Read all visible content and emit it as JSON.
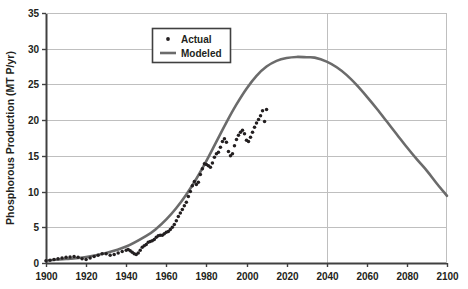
{
  "chart_data": {
    "type": "line",
    "title": "",
    "xlabel": "",
    "ylabel": "Phosphorous Production (MT P/yr)",
    "xlim": [
      1900,
      2100
    ],
    "ylim": [
      0,
      35
    ],
    "grid": "horizontal-and-vertical-major",
    "legend_position": "top-center",
    "xticks": [
      1900,
      1920,
      1940,
      1960,
      1980,
      2000,
      2020,
      2040,
      2060,
      2080,
      2100
    ],
    "yticks": [
      0,
      5,
      10,
      15,
      20,
      25,
      30,
      35
    ],
    "xtick_labels": [
      "1900",
      "1920",
      "1940",
      "1960",
      "1980",
      "2000",
      "2020",
      "2040",
      "2060",
      "2080",
      "2100"
    ],
    "ytick_labels": [
      "0",
      "5",
      "10",
      "15",
      "20",
      "25",
      "30",
      "35"
    ],
    "series": [
      {
        "name": "Actual",
        "type": "scatter",
        "marker": "dot",
        "color": "#231f20",
        "x": [
          1900,
          1902,
          1904,
          1906,
          1908,
          1910,
          1912,
          1914,
          1916,
          1918,
          1920,
          1922,
          1924,
          1926,
          1928,
          1930,
          1932,
          1934,
          1936,
          1938,
          1940,
          1941,
          1942,
          1943,
          1944,
          1945,
          1946,
          1947,
          1948,
          1949,
          1950,
          1951,
          1952,
          1953,
          1954,
          1955,
          1956,
          1957,
          1958,
          1959,
          1960,
          1961,
          1962,
          1963,
          1964,
          1965,
          1966,
          1967,
          1968,
          1969,
          1970,
          1971,
          1972,
          1973,
          1974,
          1975,
          1976,
          1977,
          1978,
          1979,
          1980,
          1981,
          1982,
          1983,
          1984,
          1985,
          1986,
          1987,
          1988,
          1989,
          1990,
          1991,
          1992,
          1993,
          1994,
          1995,
          1996,
          1997,
          1998,
          1999,
          2000,
          2001,
          2002,
          2003,
          2004,
          2005,
          2006,
          2007,
          2008,
          2009,
          2010
        ],
        "y": [
          0.3,
          0.4,
          0.5,
          0.6,
          0.7,
          0.8,
          0.85,
          0.9,
          0.8,
          0.6,
          0.5,
          0.7,
          0.9,
          1.1,
          1.3,
          1.3,
          1.1,
          1.2,
          1.4,
          1.6,
          1.8,
          1.9,
          1.7,
          1.5,
          1.3,
          1.2,
          1.4,
          1.8,
          2.2,
          2.4,
          2.6,
          2.9,
          3.0,
          3.1,
          3.3,
          3.6,
          3.8,
          3.9,
          3.9,
          4.1,
          4.3,
          4.4,
          4.7,
          5.0,
          5.4,
          5.9,
          6.5,
          7.0,
          7.5,
          8.0,
          8.5,
          9.3,
          10.0,
          10.8,
          11.4,
          11.0,
          11.3,
          12.4,
          13.2,
          13.9,
          13.8,
          13.6,
          13.4,
          14.0,
          14.8,
          15.3,
          15.5,
          16.2,
          17.0,
          17.4,
          16.9,
          15.6,
          15.0,
          15.3,
          16.4,
          17.3,
          17.9,
          18.3,
          18.6,
          18.1,
          17.2,
          17.0,
          17.6,
          18.3,
          19.0,
          19.6,
          20.1,
          20.6,
          21.3,
          19.8,
          21.5
        ]
      },
      {
        "name": "Modeled",
        "type": "line",
        "color": "#6b6b6b",
        "x": [
          1900,
          1910,
          1920,
          1930,
          1940,
          1950,
          1955,
          1960,
          1965,
          1970,
          1975,
          1980,
          1985,
          1990,
          1995,
          2000,
          2005,
          2010,
          2015,
          2020,
          2025,
          2030,
          2034,
          2040,
          2045,
          2050,
          2055,
          2060,
          2065,
          2070,
          2075,
          2080,
          2085,
          2090,
          2095,
          2100
        ],
        "y": [
          0.35,
          0.55,
          0.85,
          1.4,
          2.3,
          3.8,
          4.8,
          6.1,
          7.7,
          9.6,
          11.8,
          14.3,
          17.0,
          19.7,
          22.2,
          24.4,
          26.2,
          27.5,
          28.3,
          28.7,
          28.85,
          28.8,
          28.75,
          28.2,
          27.4,
          26.3,
          24.9,
          23.3,
          21.6,
          19.8,
          18.0,
          16.2,
          14.5,
          12.9,
          11.1,
          9.4
        ]
      }
    ],
    "legend_entries": [
      {
        "label": "Actual",
        "marker": "dot",
        "color": "#231f20"
      },
      {
        "label": "Modeled",
        "marker": "line",
        "color": "#6b6b6b"
      }
    ],
    "colors": {
      "actual": "#231f20",
      "modeled": "#6b6b6b",
      "grid": "#bfbfbf",
      "axis": "#404040",
      "text": "#231f20",
      "background": "#ffffff",
      "legend_border": "#404040"
    }
  }
}
